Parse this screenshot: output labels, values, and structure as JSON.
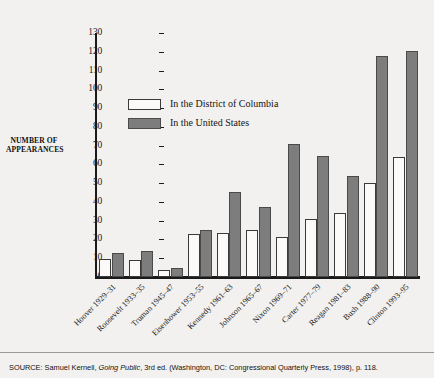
{
  "chart_data": {
    "type": "bar",
    "title": "",
    "xlabel": "",
    "ylabel": "NUMBER OF APPEARANCES",
    "ylabel_lines": [
      "NUMBER OF",
      "APPEARANCES"
    ],
    "ylim": [
      0,
      130
    ],
    "ytick_step": 10,
    "yticks": [
      0,
      10,
      20,
      30,
      40,
      50,
      60,
      70,
      80,
      90,
      100,
      110,
      120,
      130
    ],
    "grid": false,
    "legend_position": "upper-left-inside",
    "categories": [
      "Hoover 1929–31",
      "Roosevelt 1933–35",
      "Truman 1945–47",
      "Eisenhower 1953–55",
      "Kennedy 1961–63",
      "Johnson 1965–67",
      "Nixon 1969–71",
      "Carter 1977–79",
      "Reagan 1981–83",
      "Bush 1988–90",
      "Clinton 1993–95"
    ],
    "series": [
      {
        "name": "In the District of Columbia",
        "color": "#fbfaf8",
        "values": [
          9.5,
          9,
          3.5,
          23,
          23.5,
          25,
          21.5,
          31,
          34,
          50,
          64
        ]
      },
      {
        "name": "In the United States",
        "color": "#7d7d7d",
        "values": [
          13,
          14,
          5,
          25,
          45.5,
          37.5,
          71,
          64.5,
          54,
          118,
          120.5
        ]
      }
    ]
  },
  "legend": {
    "items": [
      {
        "label": "In the District of Columbia",
        "swatch": "dc"
      },
      {
        "label": "In the United States",
        "swatch": "us"
      }
    ]
  },
  "source": {
    "prefix": "SOURCE: Samuel Kernell, ",
    "italic": "Going Public",
    "suffix": ", 3rd ed. (Washington, DC: Congressional Quarterly Press, 1998), p. 118."
  }
}
